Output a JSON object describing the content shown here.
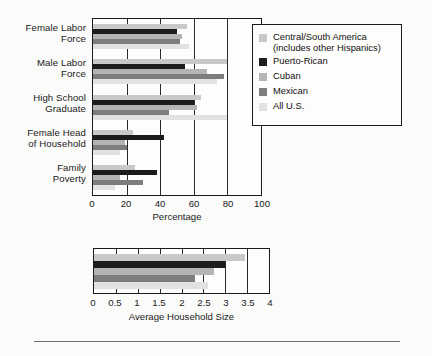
{
  "figure": {
    "background": "#fbfbfa",
    "axis_color": "#1b1b1b"
  },
  "legend": {
    "position": "top-right",
    "entries": [
      {
        "label": "Central/South America\n(includes other Hispanics)",
        "color": "#c9c9c9"
      },
      {
        "label": "Puerto-Rican",
        "color": "#1c1c1c"
      },
      {
        "label": "Cuban",
        "color": "#b4b4b4"
      },
      {
        "label": "Mexican",
        "color": "#7d7d7d"
      },
      {
        "label": "All U.S.",
        "color": "#e2e2e2"
      }
    ]
  },
  "chart_data": [
    {
      "type": "bar",
      "orientation": "horizontal",
      "title": "",
      "xlabel": "Percentage",
      "ylabel": "",
      "xlim": [
        0,
        100
      ],
      "xticks": [
        0,
        20,
        40,
        60,
        80,
        100
      ],
      "grid": true,
      "categories": [
        "Female Labor\nForce",
        "Male Labor\nForce",
        "High School\nGraduate",
        "Female Head\nof Household",
        "Family\nPoverty"
      ],
      "series": [
        {
          "name": "Central/South America (includes other Hispanics)",
          "color": "#c9c9c9",
          "values": [
            56,
            80,
            64,
            24,
            25
          ]
        },
        {
          "name": "Puerto-Rican",
          "color": "#1c1c1c",
          "values": [
            50,
            55,
            60,
            42,
            38
          ]
        },
        {
          "name": "Cuban",
          "color": "#b4b4b4",
          "values": [
            53,
            68,
            62,
            19,
            16
          ]
        },
        {
          "name": "Mexican",
          "color": "#7d7d7d",
          "values": [
            52,
            78,
            45,
            20,
            30
          ]
        },
        {
          "name": "All U.S.",
          "color": "#e2e2e2",
          "values": [
            57,
            74,
            80,
            16,
            13
          ]
        }
      ]
    },
    {
      "type": "bar",
      "orientation": "horizontal",
      "title": "",
      "xlabel": "Average Household Size",
      "ylabel": "",
      "xlim": [
        0,
        4
      ],
      "xticks": [
        0,
        0.5,
        1,
        1.5,
        2,
        2.5,
        3,
        3.5,
        4
      ],
      "grid": true,
      "categories": [
        ""
      ],
      "series": [
        {
          "name": "Central/South America (includes other Hispanics)",
          "color": "#c9c9c9",
          "values": [
            3.45
          ]
        },
        {
          "name": "Puerto-Rican",
          "color": "#1c1c1c",
          "values": [
            3.0
          ]
        },
        {
          "name": "Cuban",
          "color": "#b4b4b4",
          "values": [
            2.75
          ]
        },
        {
          "name": "Mexican",
          "color": "#7d7d7d",
          "values": [
            2.3
          ]
        },
        {
          "name": "All U.S.",
          "color": "#e2e2e2",
          "values": [
            2.6
          ]
        }
      ]
    }
  ],
  "top_axis": {
    "ticks": [
      "0",
      "20",
      "40",
      "60",
      "80",
      "100"
    ],
    "label": "Percentage"
  },
  "bottom_axis": {
    "ticks": [
      "0",
      "0.5",
      "1",
      "1.5",
      "2",
      "2.5",
      "3",
      "3.5",
      "4"
    ],
    "label": "Average Household Size"
  },
  "y_labels_top": [
    "Female Labor\nForce",
    "Male Labor\nForce",
    "High School\nGraduate",
    "Female Head\nof Household",
    "Family\nPoverty"
  ]
}
